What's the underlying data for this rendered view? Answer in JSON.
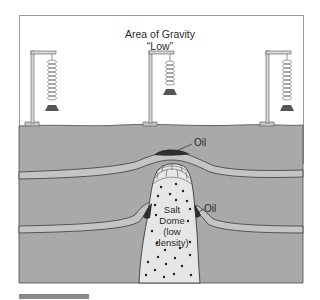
{
  "diagram": {
    "title_line1": "Area of Gravity",
    "title_line2": "“Low”",
    "labels": {
      "oil_top": "Oil",
      "oil_side": "Oil",
      "salt_line1": "Salt",
      "salt_line2": "Dome",
      "salt_line3": "(low",
      "salt_line4": "density)"
    },
    "gravimeters": [
      {
        "position": "left",
        "spring_state": "extended"
      },
      {
        "position": "center",
        "spring_state": "compressed"
      },
      {
        "position": "right",
        "spring_state": "extended"
      }
    ],
    "colors": {
      "background": "#ffffff",
      "rock": "#a9a9a9",
      "stratum": "#c4c4c4",
      "salt": "#e6e6e6",
      "oil": "#2e2e2e",
      "outline": "#3a3a3a",
      "scale_bar": "#8a8a8a"
    }
  }
}
